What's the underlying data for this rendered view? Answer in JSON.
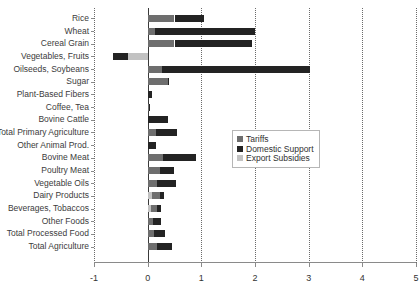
{
  "chart_data": {
    "type": "bar",
    "orientation": "horizontal",
    "stacked": true,
    "title": "",
    "subtitle": "",
    "xlabel": "",
    "ylabel": "",
    "xlim": [
      -1,
      5
    ],
    "xticks": [
      -1,
      0,
      1,
      2,
      3,
      4,
      5
    ],
    "xtick_labels": [
      "-1",
      "0",
      "1",
      "2",
      "3",
      "4",
      "5"
    ],
    "grid": "vertical-dotted",
    "legend_position": "center-right-inside",
    "categories": [
      "Rice",
      "Wheat",
      "Cereal Grain",
      "Vegetables, Fruits",
      "Oilseeds, Soybeans",
      "Sugar",
      "Plant-Based Fibers",
      "Coffee, Tea",
      "Bovine Cattle",
      "Total Primary Agriculture",
      "Other Animal Prod.",
      "Bovine Meat",
      "Poultry Meat",
      "Vegetable Oils",
      "Dairy Products",
      "Beverages, Tobaccos",
      "Other Foods",
      "Total Processed Food",
      "Total Agriculture"
    ],
    "series": [
      {
        "name": "Tariffs",
        "color": "#6e6e6e",
        "values": [
          0.5,
          0.13,
          0.5,
          0.0,
          0.27,
          0.38,
          0.0,
          0.02,
          0.0,
          0.15,
          0.0,
          0.28,
          0.23,
          0.17,
          0.14,
          0.1,
          0.1,
          0.11,
          0.17
        ]
      },
      {
        "name": "Domestic Support",
        "color": "#232323",
        "values": [
          0.55,
          1.87,
          1.45,
          -0.28,
          2.75,
          0.02,
          0.09,
          0.01,
          0.38,
          0.4,
          0.15,
          0.62,
          0.27,
          0.35,
          0.07,
          0.08,
          0.14,
          0.22,
          0.28
        ]
      },
      {
        "name": "Export Subsidies",
        "color": "#c2c2c2",
        "values": [
          0.0,
          0.0,
          0.0,
          -0.37,
          0.0,
          0.0,
          0.0,
          0.0,
          0.0,
          0.0,
          0.0,
          0.0,
          0.0,
          0.0,
          0.09,
          0.07,
          0.0,
          0.0,
          0.0
        ]
      }
    ],
    "totals": [
      1.05,
      2.0,
      1.95,
      -0.65,
      3.02,
      0.4,
      0.09,
      0.03,
      0.38,
      0.55,
      0.15,
      0.9,
      0.5,
      0.52,
      0.3,
      0.25,
      0.24,
      0.33,
      0.45
    ]
  },
  "legend": {
    "items": [
      {
        "label": "Tariffs",
        "color": "#6e6e6e"
      },
      {
        "label": "Domestic Support",
        "color": "#232323"
      },
      {
        "label": "Export Subsidies",
        "color": "#c2c2c2"
      }
    ]
  }
}
